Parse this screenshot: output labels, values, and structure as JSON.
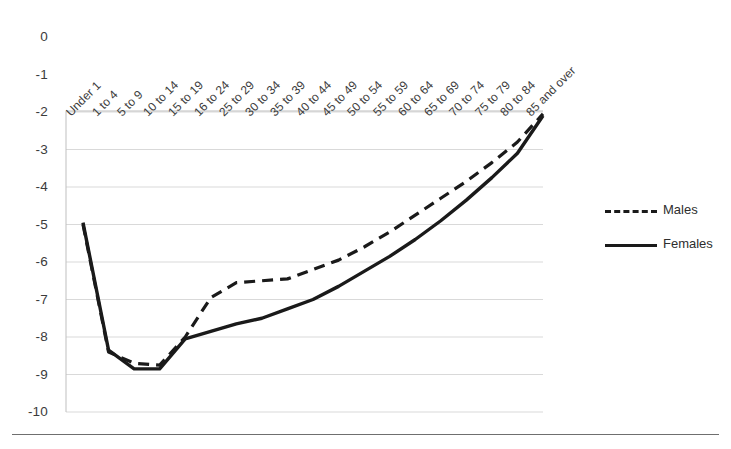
{
  "chart_data": {
    "type": "line",
    "title": "",
    "subtitle": "",
    "xlabel": "",
    "ylabel": "",
    "grid": true,
    "legend_position": "right",
    "ylim": [
      -10,
      0
    ],
    "yticks": [
      "0",
      "-1",
      "-2",
      "-3",
      "-4",
      "-5",
      "-6",
      "-7",
      "-8",
      "-9",
      "-10"
    ],
    "ytick_values": [
      0,
      -1,
      -2,
      -3,
      -4,
      -5,
      -6,
      -7,
      -8,
      -9,
      -10
    ],
    "categories": [
      "Under 1",
      "1 to 4",
      "5 to 9",
      "10 to 14",
      "15 to 19",
      "16 to 24",
      "25 to 29",
      "30 to 34",
      "35 to 39",
      "40 to 44",
      "45 to 49",
      "50 to 54",
      "55 to 59",
      "60 to 64",
      "65 to 69",
      "70 to 74",
      "75 to 79",
      "80 to 84",
      "85 and over"
    ],
    "series": [
      {
        "name": "Males",
        "style": "dashed",
        "color": "#1a1a1a",
        "values": [
          -5.0,
          -8.4,
          -8.7,
          -8.75,
          -8.0,
          -6.95,
          -6.55,
          -6.5,
          -6.45,
          -6.2,
          -5.95,
          -5.6,
          -5.2,
          -4.75,
          -4.3,
          -3.85,
          -3.35,
          -2.8,
          -2.05
        ]
      },
      {
        "name": "Females",
        "style": "solid",
        "color": "#1a1a1a",
        "values": [
          -4.95,
          -8.35,
          -8.85,
          -8.85,
          -8.05,
          -7.85,
          -7.65,
          -7.5,
          -7.25,
          -7.0,
          -6.65,
          -6.25,
          -5.85,
          -5.4,
          -4.9,
          -4.35,
          -3.75,
          -3.1,
          -2.1
        ]
      }
    ]
  },
  "legend": {
    "items": [
      {
        "label": "Males"
      },
      {
        "label": "Females"
      }
    ]
  },
  "colors": {
    "line": "#1a1a1a",
    "grid": "#d9d9d9",
    "axis": "#bfbfbf",
    "text": "#3b3b3b",
    "rule": "#6f6f6f"
  }
}
